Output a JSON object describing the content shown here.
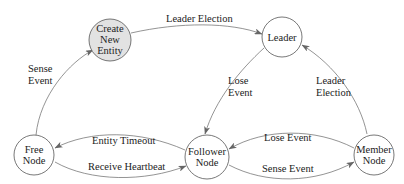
{
  "diagram": {
    "type": "state-machine",
    "colors": {
      "stroke": "#555555",
      "highlight_fill": "#e2e2e2",
      "node_fill": "#ffffff"
    },
    "nodes": [
      {
        "id": "create",
        "lines": [
          "Create",
          "New",
          "Entity"
        ],
        "highlighted": true
      },
      {
        "id": "leader",
        "lines": [
          "Leader"
        ],
        "highlighted": false
      },
      {
        "id": "free",
        "lines": [
          "Free",
          "Node"
        ],
        "highlighted": false
      },
      {
        "id": "follower",
        "lines": [
          "Follower",
          "Node"
        ],
        "highlighted": false
      },
      {
        "id": "member",
        "lines": [
          "Member",
          "Node"
        ],
        "highlighted": false
      }
    ],
    "edges": [
      {
        "from": "free",
        "to": "create",
        "label": [
          "Sense",
          "Event"
        ]
      },
      {
        "from": "create",
        "to": "leader",
        "label": [
          "Leader Election"
        ]
      },
      {
        "from": "leader",
        "to": "follower",
        "label": [
          "Lose",
          "Event"
        ]
      },
      {
        "from": "member",
        "to": "leader",
        "label": [
          "Leader",
          "Election"
        ]
      },
      {
        "from": "follower",
        "to": "free",
        "label": [
          "Entity Timeout"
        ]
      },
      {
        "from": "free",
        "to": "follower",
        "label": [
          "Receive Heartbeat"
        ]
      },
      {
        "from": "member",
        "to": "follower",
        "label": [
          "Lose Event"
        ]
      },
      {
        "from": "follower",
        "to": "member",
        "label": [
          "Sense Event"
        ]
      }
    ]
  }
}
